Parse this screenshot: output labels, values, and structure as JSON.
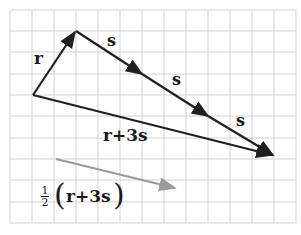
{
  "diagram": {
    "type": "vector-addition",
    "grid": {
      "cols": 13,
      "rows": 10,
      "color": "#cfcfcf"
    },
    "colors": {
      "vector": "#1f1f1f",
      "half_vector": "#9a9a9a"
    },
    "labels": {
      "r": "r",
      "s1": "s",
      "s2": "s",
      "s3": "s",
      "sum": "r+3s",
      "half_coef_num": "1",
      "half_coef_den": "2",
      "half_open": "(",
      "half_body": "r+3s",
      "half_close": ")"
    },
    "vectors": [
      {
        "name": "r",
        "from": [
          0,
          0
        ],
        "to": [
          2,
          3
        ]
      },
      {
        "name": "s",
        "from": [
          2,
          3
        ],
        "to": [
          5,
          1
        ]
      },
      {
        "name": "s",
        "from": [
          5,
          1
        ],
        "to": [
          8,
          -1
        ]
      },
      {
        "name": "s",
        "from": [
          8,
          -1
        ],
        "to": [
          11,
          -3
        ]
      },
      {
        "name": "r+3s",
        "from": [
          0,
          0
        ],
        "to": [
          11,
          -3
        ]
      },
      {
        "name": "1/2(r+3s)",
        "from": [
          1,
          -3
        ],
        "to": [
          6.5,
          -4.5
        ]
      }
    ]
  }
}
